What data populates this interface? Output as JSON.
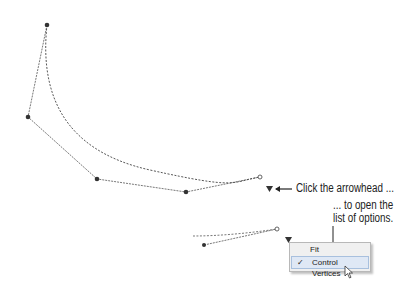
{
  "annotations": {
    "click_arrowhead": "Click the arrowhead ...",
    "open_list_line1": "... to open the",
    "open_list_line2": "list of options."
  },
  "menu": {
    "items": [
      {
        "label": "Fit",
        "checked": false
      },
      {
        "label": "Control Vertices",
        "checked": true,
        "hovered": true
      }
    ],
    "check_glyph": "✓"
  },
  "icons": {
    "arrowhead": "down-triangle",
    "cursor": "mouse-pointer"
  }
}
